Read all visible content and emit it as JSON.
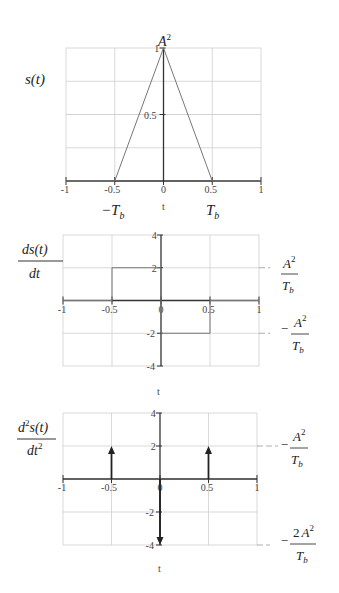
{
  "chart_data": [
    {
      "type": "line",
      "title": "",
      "ylabel": "s(t)",
      "xlabel": "t",
      "xlim": [
        -1,
        1
      ],
      "ylim": [
        0,
        1
      ],
      "x_ticks": [
        "-1",
        "-0.5",
        "0",
        "0.5",
        "1"
      ],
      "y_ticks": [
        "0.5",
        "1"
      ],
      "x": [
        -1,
        -0.5,
        0,
        0.5,
        1
      ],
      "values": [
        0,
        0,
        1,
        0,
        0
      ],
      "annotations": [
        "A^2",
        "-T_b",
        "T_b"
      ],
      "grid": true
    },
    {
      "type": "line",
      "title": "",
      "ylabel": "ds(t)/dt",
      "xlabel": "t",
      "xlim": [
        -1,
        1
      ],
      "ylim": [
        -4,
        4
      ],
      "x_ticks": [
        "-1",
        "-0.5",
        "0",
        "0.5",
        "1"
      ],
      "y_ticks": [
        "-4",
        "-2",
        "2",
        "4"
      ],
      "x": [
        -1,
        -0.5,
        -0.5,
        0,
        0,
        0.5,
        0.5,
        1
      ],
      "values": [
        0,
        0,
        2,
        2,
        -2,
        -2,
        0,
        0
      ],
      "annotations": [
        "A^2/T_b",
        "-A^2/T_b"
      ],
      "grid": true
    },
    {
      "type": "line",
      "title": "",
      "ylabel": "d^2 s(t)/dt^2",
      "xlabel": "t",
      "xlim": [
        -1,
        1
      ],
      "ylim": [
        -4,
        4
      ],
      "x_ticks": [
        "-1",
        "-0.5",
        "0",
        "0.5",
        "1"
      ],
      "y_ticks": [
        "-4",
        "-2",
        "2",
        "4"
      ],
      "impulses": [
        {
          "x": -0.5,
          "value": 2
        },
        {
          "x": 0,
          "value": -4
        },
        {
          "x": 0.5,
          "value": 2
        }
      ],
      "annotations": [
        "A^2/T_b",
        "-2A^2/T_b"
      ],
      "grid": true
    }
  ],
  "labels": {
    "p1": {
      "ylabel": "s(t)",
      "peak": "A",
      "peak_sup": "2",
      "left": "−T",
      "left_sub": "b",
      "right": "T",
      "right_sub": "b",
      "xlabel": "t"
    },
    "p2": {
      "ylabel_num": "ds(t)",
      "ylabel_den": "dt",
      "pos_num": "A",
      "pos_sup": "2",
      "pos_den": "T",
      "pos_sub": "b",
      "neg_sign": "−",
      "xlabel": "t"
    },
    "p3": {
      "ylabel_num": "d",
      "ylabel_num_sup": "2",
      "ylabel_num_rest": "s(t)",
      "ylabel_den": "dt",
      "ylabel_den_sup": "2",
      "pos_sign": "−",
      "neg_coef": "2",
      "xlabel": "t"
    }
  }
}
